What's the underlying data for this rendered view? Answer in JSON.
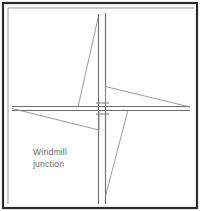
{
  "figure": {
    "background_color": "#ffffff",
    "line_color": "#6f6f6f",
    "frame_color": "#2b2b2b",
    "width": 200,
    "height": 211
  },
  "caption": {
    "line1": "Windmill",
    "line2": "junction",
    "color": "#6b6b6b",
    "x": 33,
    "y": 155
  },
  "frame": {
    "outer": {
      "x": 3,
      "y": 3,
      "width": 194,
      "height": 205
    },
    "inner": {
      "x": 8,
      "y": 8,
      "width": 186,
      "height": 196
    }
  },
  "chart_data": {
    "type": "line",
    "title": "Windmill junction",
    "xlabel": "",
    "ylabel": "",
    "xlim": [
      0,
      200
    ],
    "ylim": [
      0,
      211
    ],
    "grid": false,
    "legend": "none",
    "series": [
      {
        "name": "vertical-road-west-edge",
        "x": [
          98.5,
          98.5
        ],
        "y": [
          14,
          204
        ]
      },
      {
        "name": "vertical-road-east-edge",
        "x": [
          105.5,
          105.5
        ],
        "y": [
          13,
          204
        ]
      },
      {
        "name": "horizontal-road-north-edge",
        "x": [
          12,
          190
        ],
        "y": [
          106.5,
          106.5
        ]
      },
      {
        "name": "horizontal-road-south-edge",
        "x": [
          12,
          190
        ],
        "y": [
          110.5,
          110.5
        ]
      },
      {
        "name": "north-west-diagonal-spur",
        "x": [
          98.5,
          78
        ],
        "y": [
          16,
          107
        ]
      },
      {
        "name": "south-east-diagonal-spur",
        "x": [
          105.5,
          128
        ],
        "y": [
          196,
          110
        ]
      },
      {
        "name": "east-wedge-upper",
        "x": [
          105.5,
          190
        ],
        "y": [
          86.5,
          107
        ]
      },
      {
        "name": "east-wedge-stub",
        "x": [
          105.5,
          105.5
        ],
        "y": [
          86.5,
          106.5
        ]
      },
      {
        "name": "west-wedge-lower",
        "x": [
          12,
          99
        ],
        "y": [
          108.5,
          130
        ]
      },
      {
        "name": "west-wedge-stub",
        "x": [
          99,
          99
        ],
        "y": [
          110.5,
          130
        ]
      }
    ],
    "junction_ticks": [
      {
        "name": "tick-above-junction",
        "x": [
          96,
          109
        ],
        "y": [
          103,
          103
        ]
      },
      {
        "name": "tick-below-junction",
        "x": [
          96,
          109
        ],
        "y": [
          114,
          114
        ]
      }
    ]
  }
}
